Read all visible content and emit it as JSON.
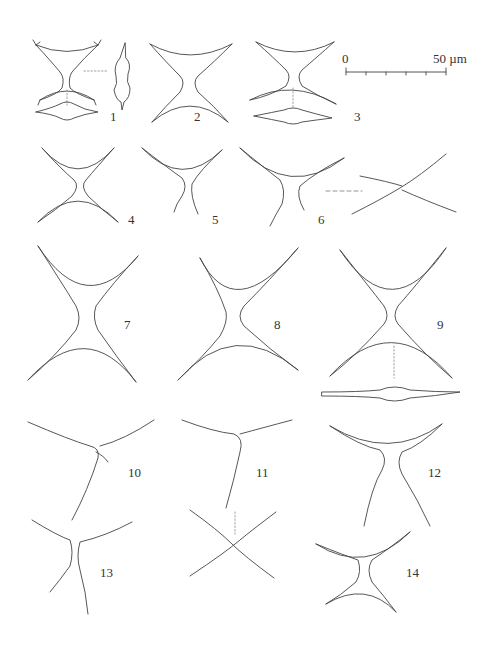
{
  "plate": {
    "description": "Plate of line drawings of 14 numbered specimen figures (four-armed cells in front, side and apical views)",
    "figure_labels": [
      "1",
      "2",
      "3",
      "4",
      "5",
      "6",
      "7",
      "8",
      "9",
      "10",
      "11",
      "12",
      "13",
      "14"
    ],
    "scale_bar": {
      "start_label": "0",
      "end_label": "50 µm",
      "segments": 5
    }
  }
}
